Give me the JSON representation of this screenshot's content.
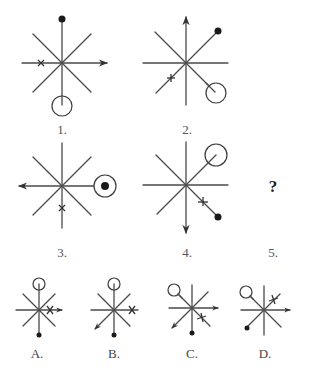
{
  "puzzle": {
    "sequence": [
      {
        "label": "1.",
        "arrow_direction": "east",
        "dot_direction": "north",
        "circle_direction": "south",
        "cross_direction": "west",
        "dot_in_circle": false
      },
      {
        "label": "2.",
        "arrow_direction": "north",
        "dot_direction": "northeast",
        "circle_direction": "southeast",
        "cross_direction": "southwest",
        "dot_in_circle": false
      },
      {
        "label": "3.",
        "arrow_direction": "west",
        "dot_direction": "east",
        "circle_direction": "east",
        "cross_direction": "south",
        "dot_in_circle": true
      },
      {
        "label": "4.",
        "arrow_direction": "south",
        "dot_direction": "southeast",
        "circle_direction": "northeast",
        "cross_direction": "southeast",
        "dot_in_circle": false
      },
      {
        "label": "5.",
        "unknown_symbol": "?"
      }
    ],
    "options": [
      {
        "label": "A.",
        "arrow_direction": "east",
        "dot_direction": "south",
        "circle_direction": "north",
        "cross_direction": "east"
      },
      {
        "label": "B.",
        "arrow_direction": "southwest",
        "dot_direction": "south",
        "circle_direction": "north",
        "cross_direction": "east"
      },
      {
        "label": "C.",
        "arrow_direction": "east",
        "second_arrow_direction": "southwest",
        "dot_direction": "south",
        "circle_direction": "northwest",
        "cross_direction": "southeast"
      },
      {
        "label": "D.",
        "arrow_direction": "east",
        "dot_direction": "southwest",
        "circle_direction": "northwest",
        "cross_direction": "northeast"
      }
    ]
  }
}
